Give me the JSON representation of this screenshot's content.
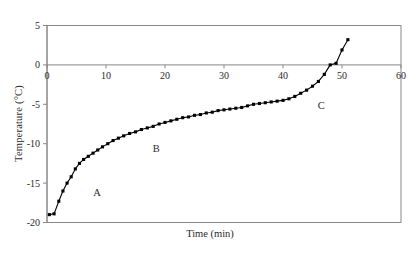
{
  "figure": {
    "ylabel": "Temperature (°C)",
    "xlabel": "Time (min)"
  },
  "annotations": {
    "a": "A",
    "b": "B",
    "c": "C"
  },
  "ticks": {
    "x": [
      "0",
      "10",
      "20",
      "30",
      "40",
      "50",
      "60"
    ],
    "y": [
      "5",
      "0",
      "-5",
      "-10",
      "-15",
      "-20"
    ]
  },
  "colors": {
    "frame": "#888888",
    "axis": "#888888",
    "series": "#000000",
    "background": "#ffffff"
  },
  "chart_data": {
    "type": "line",
    "title": "",
    "xlabel": "Time (min)",
    "ylabel": "Temperature (°C)",
    "xlim": [
      0,
      60
    ],
    "ylim": [
      -20,
      5
    ],
    "xticks": [
      0,
      10,
      20,
      30,
      40,
      50,
      60
    ],
    "yticks": [
      -20,
      -15,
      -10,
      -5,
      0,
      5
    ],
    "grid": false,
    "legend": null,
    "marker": "square",
    "annotations": [
      {
        "label": "A",
        "x": 8.5,
        "y": -16.6
      },
      {
        "label": "B",
        "x": 18.5,
        "y": -11.1
      },
      {
        "label": "C",
        "x": 46.5,
        "y": -5.6
      }
    ],
    "series": [
      {
        "name": "Temperature vs time",
        "x": [
          0.4,
          1.2,
          2.0,
          2.7,
          3.4,
          4.1,
          4.8,
          5.5,
          6.2,
          7.0,
          7.8,
          8.6,
          9.4,
          10.3,
          11.2,
          12.1,
          13.0,
          14.0,
          15.0,
          16.0,
          17.0,
          18.0,
          19.0,
          20.0,
          21.0,
          22.0,
          23.0,
          24.0,
          25.0,
          26.0,
          27.0,
          28.0,
          29.0,
          30.0,
          31.0,
          32.0,
          33.0,
          34.0,
          35.0,
          36.0,
          37.0,
          38.0,
          39.0,
          40.0,
          41.0,
          42.0,
          43.0,
          44.0,
          45.0,
          46.0,
          47.0,
          48.0,
          49.0,
          50.0,
          51.0
        ],
        "y": [
          -19.0,
          -18.9,
          -17.3,
          -16.0,
          -15.0,
          -14.2,
          -13.2,
          -12.5,
          -12.0,
          -11.6,
          -11.2,
          -10.8,
          -10.4,
          -10.0,
          -9.6,
          -9.3,
          -9.0,
          -8.7,
          -8.5,
          -8.2,
          -8.0,
          -7.8,
          -7.5,
          -7.3,
          -7.1,
          -6.9,
          -6.7,
          -6.6,
          -6.4,
          -6.3,
          -6.1,
          -6.0,
          -5.8,
          -5.7,
          -5.6,
          -5.5,
          -5.4,
          -5.2,
          -5.0,
          -4.9,
          -4.8,
          -4.7,
          -4.6,
          -4.5,
          -4.3,
          -4.0,
          -3.6,
          -3.2,
          -2.7,
          -2.1,
          -1.2,
          0.0,
          0.2,
          1.9,
          3.2
        ]
      }
    ]
  }
}
